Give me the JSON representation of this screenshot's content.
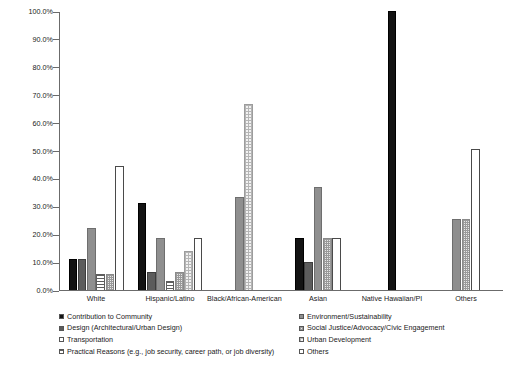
{
  "chart_data": {
    "type": "bar",
    "title": "",
    "subtitle": "",
    "xlabel": "",
    "ylabel": "",
    "ylim": [
      0,
      100
    ],
    "y_tick_labels": [
      "0.0%",
      "10.0%",
      "20.0%",
      "30.0%",
      "40.0%",
      "50.0%",
      "60.0%",
      "70.0%",
      "80.0%",
      "90.0%",
      "100.0%"
    ],
    "y_tick_values": [
      0,
      10,
      20,
      30,
      40,
      50,
      60,
      70,
      80,
      90,
      100
    ],
    "grid": false,
    "legend_position": "bottom",
    "categories": [
      "White",
      "Hispanic/Latino",
      "Black/African-American",
      "Asian",
      "Native Hawaiian/PI",
      "Others"
    ],
    "series": [
      {
        "name": "Contribution to Community",
        "fill": "solid-black",
        "color": "#131313",
        "values": [
          11.1,
          31.3,
          0,
          18.5,
          100.0,
          0
        ]
      },
      {
        "name": "Design (Architectural/Urban Design)",
        "fill": "solid-dark-gray",
        "color": "#5c5c5c",
        "values": [
          11.1,
          6.3,
          0,
          10.0,
          0,
          0
        ]
      },
      {
        "name": "Transportation",
        "fill": "solid-gray",
        "color": "#8f8f8f",
        "values": [
          22.2,
          18.8,
          33.3,
          37.0,
          0,
          25.5
        ]
      },
      {
        "name": "Practical Reasons (e.g., job security, career path, or job diversity)",
        "fill": "horizontal-stripes",
        "color": "#5e5e5e",
        "values": [
          5.6,
          3.1,
          0,
          0,
          0,
          0
        ]
      },
      {
        "name": "Environment/Sustainability",
        "fill": "checkerboard",
        "color": "#9a9a9a",
        "values": [
          5.6,
          6.3,
          0,
          18.5,
          0,
          25.5
        ]
      },
      {
        "name": "Social Justice/Advocacy/Civic Engagement",
        "fill": "dotted",
        "color": "#b5b5b5",
        "values": [
          0,
          13.9,
          66.7,
          0,
          0,
          0
        ]
      },
      {
        "name": "Urban Development",
        "fill": "light-gray",
        "color": "#c9c9c9",
        "values": [
          0,
          0,
          0,
          0,
          0,
          0
        ]
      },
      {
        "name": "Others",
        "fill": "white",
        "color": "#ffffff",
        "values": [
          44.4,
          18.8,
          0,
          18.5,
          0,
          50.5
        ]
      }
    ]
  },
  "legend": {
    "left_column": [
      {
        "label": "Contribution to Community",
        "swatch": "solid-black"
      },
      {
        "label": "Design (Architectural/Urban Design)",
        "swatch": "solid-dark-gray"
      },
      {
        "label": "Transportation",
        "swatch": "white"
      },
      {
        "label": "Practical Reasons (e.g., job security, career path, or job diversity)",
        "swatch": "horizontal-stripes"
      }
    ],
    "right_column": [
      {
        "label": "Environment/Sustainability",
        "swatch": "solid-gray"
      },
      {
        "label": "Social Justice/Advocacy/Civic Engagement",
        "swatch": "checkerboard"
      },
      {
        "label": "Urban Development",
        "swatch": "dotted"
      },
      {
        "label": "Others",
        "swatch": "white"
      }
    ]
  },
  "colors": {
    "axis": "#6b6b6b",
    "text": "#1a1a1a",
    "background": "#ffffff"
  }
}
